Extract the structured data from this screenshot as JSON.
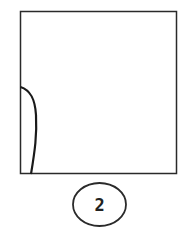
{
  "figure": {
    "label": "2",
    "stroke_color": "#2a2a2a",
    "background": "#ffffff",
    "shapes": [
      {
        "type": "square",
        "description": "outer box"
      },
      {
        "type": "curve",
        "description": "curved line along left edge of box"
      },
      {
        "type": "circle",
        "description": "label circle below box"
      }
    ]
  }
}
